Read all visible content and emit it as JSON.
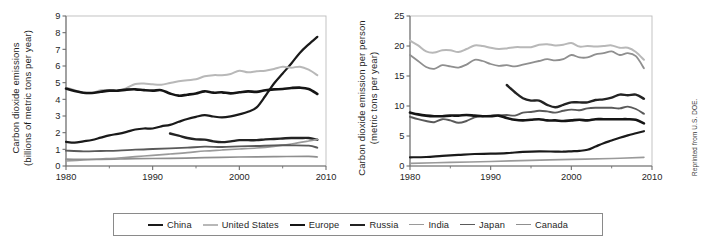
{
  "figure": {
    "credit": "Reprinted from U.S. DOE.",
    "legend": {
      "entries": [
        {
          "label": "China",
          "color": "#1a1a1a",
          "width": 2.2
        },
        {
          "label": "United States",
          "color": "#b8b8b8",
          "width": 2.0
        },
        {
          "label": "Europe",
          "color": "#151515",
          "width": 2.6
        },
        {
          "label": "Russia",
          "color": "#232323",
          "width": 2.4
        },
        {
          "label": "India",
          "color": "#9a9a9a",
          "width": 1.7
        },
        {
          "label": "Japan",
          "color": "#5a5a5a",
          "width": 1.9
        },
        {
          "label": "Canada",
          "color": "#8f8f8f",
          "width": 1.7
        }
      ]
    }
  },
  "chart_data": [
    {
      "type": "line",
      "id": "total-emissions",
      "title": "",
      "xlabel": "",
      "ylabel": "Carbon dioxide emissions (billions of metric tons per year)",
      "ylabel_lines": [
        "Carbon dioxide emissions",
        "(billions of metric tons per year)"
      ],
      "xlim": [
        1980,
        2010
      ],
      "ylim": [
        0,
        9
      ],
      "xticks": [
        1980,
        1990,
        2000,
        2010
      ],
      "xticklabels": [
        "1980",
        "1990",
        "2000",
        "2010"
      ],
      "yticks": [
        0,
        1,
        2,
        3,
        4,
        5,
        6,
        7,
        8,
        9
      ],
      "yticklabels": [
        "0",
        "1",
        "2",
        "3",
        "4",
        "5",
        "6",
        "7",
        "8",
        "9"
      ],
      "xminorticks": [
        1985,
        1995,
        2005
      ],
      "grid": false,
      "legend_position": "below-figure",
      "series": [
        {
          "name": "China",
          "color": "#1a1a1a",
          "width": 2.2,
          "x": [
            1980,
            1981,
            1982,
            1983,
            1984,
            1985,
            1986,
            1987,
            1988,
            1989,
            1990,
            1991,
            1992,
            1993,
            1994,
            1995,
            1996,
            1997,
            1998,
            1999,
            2000,
            2001,
            2002,
            2003,
            2004,
            2005,
            2006,
            2007,
            2008,
            2009
          ],
          "y": [
            1.45,
            1.4,
            1.48,
            1.56,
            1.7,
            1.84,
            1.93,
            2.05,
            2.19,
            2.25,
            2.25,
            2.38,
            2.47,
            2.65,
            2.82,
            2.95,
            3.05,
            2.97,
            2.92,
            2.98,
            3.1,
            3.25,
            3.52,
            4.2,
            4.95,
            5.55,
            6.15,
            6.8,
            7.3,
            7.75
          ]
        },
        {
          "name": "United States",
          "color": "#b8b8b8",
          "width": 2.0,
          "x": [
            1980,
            1981,
            1982,
            1983,
            1984,
            1985,
            1986,
            1987,
            1988,
            1989,
            1990,
            1991,
            1992,
            1993,
            1994,
            1995,
            1996,
            1997,
            1998,
            1999,
            2000,
            2001,
            2002,
            2003,
            2004,
            2005,
            2006,
            2007,
            2008,
            2009
          ],
          "y": [
            4.7,
            4.55,
            4.38,
            4.38,
            4.55,
            4.55,
            4.52,
            4.68,
            4.92,
            4.95,
            4.9,
            4.88,
            4.98,
            5.08,
            5.15,
            5.2,
            5.38,
            5.45,
            5.45,
            5.52,
            5.72,
            5.62,
            5.68,
            5.72,
            5.82,
            5.95,
            5.9,
            5.96,
            5.78,
            5.45
          ]
        },
        {
          "name": "Europe",
          "color": "#151515",
          "width": 2.6,
          "x": [
            1980,
            1981,
            1982,
            1983,
            1984,
            1985,
            1986,
            1987,
            1988,
            1989,
            1990,
            1991,
            1992,
            1993,
            1994,
            1995,
            1996,
            1997,
            1998,
            1999,
            2000,
            2001,
            2002,
            2003,
            2004,
            2005,
            2006,
            2007,
            2008,
            2009
          ],
          "y": [
            4.65,
            4.5,
            4.4,
            4.38,
            4.45,
            4.52,
            4.52,
            4.58,
            4.6,
            4.55,
            4.52,
            4.55,
            4.35,
            4.22,
            4.28,
            4.35,
            4.48,
            4.4,
            4.42,
            4.36,
            4.42,
            4.48,
            4.45,
            4.55,
            4.6,
            4.62,
            4.68,
            4.7,
            4.62,
            4.32
          ]
        },
        {
          "name": "Russia",
          "color": "#232323",
          "width": 2.4,
          "x": [
            1992,
            1993,
            1994,
            1995,
            1996,
            1997,
            1998,
            1999,
            2000,
            2001,
            2002,
            2003,
            2004,
            2005,
            2006,
            2007,
            2008,
            2009
          ],
          "y": [
            1.95,
            1.82,
            1.68,
            1.6,
            1.58,
            1.48,
            1.43,
            1.48,
            1.55,
            1.55,
            1.55,
            1.6,
            1.62,
            1.65,
            1.68,
            1.68,
            1.68,
            1.58
          ]
        },
        {
          "name": "India",
          "color": "#9a9a9a",
          "width": 1.7,
          "x": [
            1980,
            1982,
            1984,
            1986,
            1988,
            1990,
            1992,
            1994,
            1996,
            1998,
            2000,
            2002,
            2004,
            2006,
            2008,
            2009
          ],
          "y": [
            0.3,
            0.36,
            0.42,
            0.48,
            0.56,
            0.64,
            0.72,
            0.8,
            0.9,
            0.96,
            1.02,
            1.08,
            1.18,
            1.32,
            1.5,
            1.6
          ]
        },
        {
          "name": "Japan",
          "color": "#5a5a5a",
          "width": 1.9,
          "x": [
            1980,
            1982,
            1984,
            1986,
            1988,
            1990,
            1992,
            1994,
            1996,
            1998,
            2000,
            2002,
            2004,
            2006,
            2008,
            2009
          ],
          "y": [
            0.92,
            0.88,
            0.9,
            0.92,
            0.98,
            1.02,
            1.06,
            1.1,
            1.16,
            1.14,
            1.18,
            1.2,
            1.24,
            1.24,
            1.22,
            1.1
          ]
        },
        {
          "name": "Canada",
          "color": "#8f8f8f",
          "width": 1.7,
          "x": [
            1980,
            1984,
            1988,
            1992,
            1996,
            2000,
            2004,
            2008,
            2009
          ],
          "y": [
            0.41,
            0.4,
            0.44,
            0.46,
            0.5,
            0.54,
            0.56,
            0.58,
            0.54
          ]
        }
      ]
    },
    {
      "type": "line",
      "id": "per-person-emissions",
      "title": "",
      "xlabel": "",
      "ylabel": "Carbon dioxide emission per person (metric tons per year)",
      "ylabel_lines": [
        "Carbon dioxide emission per person",
        "(metric tons per year)"
      ],
      "xlim": [
        1980,
        2010
      ],
      "ylim": [
        0,
        25
      ],
      "xticks": [
        1980,
        1990,
        2000,
        2010
      ],
      "xticklabels": [
        "1980",
        "1990",
        "2000",
        "2010"
      ],
      "yticks": [
        0,
        5,
        10,
        15,
        20,
        25
      ],
      "yticklabels": [
        "0",
        "5",
        "10",
        "15",
        "20",
        "25"
      ],
      "xminorticks": [
        1985,
        1995,
        2005
      ],
      "grid": false,
      "legend_position": "below-figure",
      "series": [
        {
          "name": "United States",
          "color": "#b8b8b8",
          "width": 2.0,
          "x": [
            1980,
            1981,
            1982,
            1983,
            1984,
            1985,
            1986,
            1987,
            1988,
            1989,
            1990,
            1991,
            1992,
            1993,
            1994,
            1995,
            1996,
            1997,
            1998,
            1999,
            2000,
            2001,
            2002,
            2003,
            2004,
            2005,
            2006,
            2007,
            2008,
            2009
          ],
          "y": [
            20.9,
            20.1,
            19.1,
            18.9,
            19.3,
            19.3,
            19.0,
            19.5,
            20.1,
            20.0,
            19.7,
            19.5,
            19.6,
            19.8,
            19.8,
            19.8,
            20.2,
            20.3,
            20.1,
            20.2,
            20.5,
            19.9,
            20.0,
            19.9,
            20.0,
            20.1,
            19.7,
            19.7,
            19.0,
            17.7
          ]
        },
        {
          "name": "Canada",
          "color": "#8f8f8f",
          "width": 1.8,
          "x": [
            1980,
            1981,
            1982,
            1983,
            1984,
            1985,
            1986,
            1987,
            1988,
            1989,
            1990,
            1991,
            1992,
            1993,
            1994,
            1995,
            1996,
            1997,
            1998,
            1999,
            2000,
            2001,
            2002,
            2003,
            2004,
            2005,
            2006,
            2007,
            2008,
            2009
          ],
          "y": [
            18.5,
            17.5,
            16.5,
            16.2,
            16.8,
            16.6,
            16.4,
            16.9,
            17.7,
            17.5,
            17.0,
            16.7,
            16.8,
            16.6,
            16.9,
            17.2,
            17.5,
            17.8,
            17.6,
            17.8,
            18.5,
            18.1,
            18.1,
            18.6,
            18.8,
            19.1,
            18.5,
            18.8,
            18.3,
            16.3
          ]
        },
        {
          "name": "Russia",
          "color": "#232323",
          "width": 2.4,
          "x": [
            1992,
            1993,
            1994,
            1995,
            1996,
            1997,
            1998,
            1999,
            2000,
            2001,
            2002,
            2003,
            2004,
            2005,
            2006,
            2007,
            2008,
            2009
          ],
          "y": [
            13.5,
            12.3,
            11.3,
            10.9,
            10.9,
            10.2,
            9.8,
            10.2,
            10.6,
            10.6,
            10.6,
            11.0,
            11.1,
            11.4,
            11.9,
            11.8,
            11.9,
            11.2
          ]
        },
        {
          "name": "Japan",
          "color": "#5a5a5a",
          "width": 1.9,
          "x": [
            1980,
            1981,
            1982,
            1983,
            1984,
            1985,
            1986,
            1987,
            1988,
            1989,
            1990,
            1991,
            1992,
            1993,
            1994,
            1995,
            1996,
            1997,
            1998,
            1999,
            2000,
            2001,
            2002,
            2003,
            2004,
            2005,
            2006,
            2007,
            2008,
            2009
          ],
          "y": [
            8.2,
            7.8,
            7.5,
            7.3,
            7.8,
            7.6,
            7.2,
            7.5,
            8.1,
            8.3,
            8.4,
            8.4,
            8.5,
            8.4,
            8.9,
            9.0,
            9.2,
            9.1,
            8.9,
            9.2,
            9.4,
            9.3,
            9.6,
            9.7,
            9.7,
            9.7,
            9.6,
            9.9,
            9.5,
            8.7
          ]
        },
        {
          "name": "Europe",
          "color": "#151515",
          "width": 2.6,
          "x": [
            1980,
            1981,
            1982,
            1983,
            1984,
            1985,
            1986,
            1987,
            1988,
            1989,
            1990,
            1991,
            1992,
            1993,
            1994,
            1995,
            1996,
            1997,
            1998,
            1999,
            2000,
            2001,
            2002,
            2003,
            2004,
            2005,
            2006,
            2007,
            2008,
            2009
          ],
          "y": [
            8.9,
            8.6,
            8.4,
            8.3,
            8.3,
            8.4,
            8.4,
            8.5,
            8.4,
            8.3,
            8.3,
            8.4,
            8.0,
            7.7,
            7.6,
            7.7,
            7.8,
            7.6,
            7.6,
            7.5,
            7.6,
            7.7,
            7.6,
            7.8,
            7.8,
            7.8,
            7.8,
            7.8,
            7.7,
            7.1
          ]
        },
        {
          "name": "China",
          "color": "#1a1a1a",
          "width": 2.2,
          "x": [
            1980,
            1982,
            1984,
            1986,
            1988,
            1990,
            1992,
            1994,
            1996,
            1998,
            1999,
            2000,
            2001,
            2002,
            2003,
            2004,
            2005,
            2006,
            2007,
            2008,
            2009
          ],
          "y": [
            1.45,
            1.5,
            1.7,
            1.85,
            2.0,
            2.05,
            2.15,
            2.35,
            2.45,
            2.4,
            2.38,
            2.45,
            2.52,
            2.7,
            3.25,
            3.8,
            4.25,
            4.7,
            5.1,
            5.45,
            5.8
          ]
        },
        {
          "name": "India",
          "color": "#9a9a9a",
          "width": 1.7,
          "x": [
            1980,
            1985,
            1990,
            1995,
            2000,
            2005,
            2009
          ],
          "y": [
            0.45,
            0.6,
            0.75,
            0.95,
            1.1,
            1.25,
            1.45
          ]
        }
      ]
    }
  ]
}
